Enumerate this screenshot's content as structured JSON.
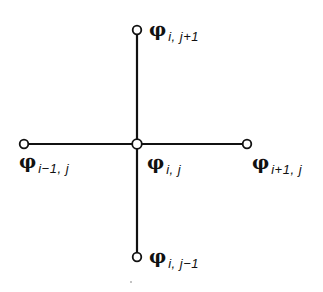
{
  "diagram": {
    "title": "",
    "type": "five-point finite-difference stencil",
    "colors": {
      "stroke": "#111111",
      "node_fill": "#ffffff",
      "background": "#ffffff"
    },
    "nodes": [
      {
        "id": "center",
        "symbol": "φ",
        "subscript": "i, j",
        "x": 137,
        "y": 144
      },
      {
        "id": "north",
        "symbol": "φ",
        "subscript": "i, j+1",
        "x": 137,
        "y": 30
      },
      {
        "id": "south",
        "symbol": "φ",
        "subscript": "i, j−1",
        "x": 137,
        "y": 257
      },
      {
        "id": "west",
        "symbol": "φ",
        "subscript": "i−1, j",
        "x": 24,
        "y": 144
      },
      {
        "id": "east",
        "symbol": "φ",
        "subscript": "i+1, j",
        "x": 247,
        "y": 144
      }
    ],
    "edges": [
      {
        "from": "center",
        "to": "north"
      },
      {
        "from": "center",
        "to": "south"
      },
      {
        "from": "center",
        "to": "west"
      },
      {
        "from": "center",
        "to": "east"
      }
    ]
  }
}
